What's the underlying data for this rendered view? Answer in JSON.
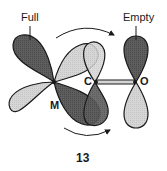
{
  "diagram": {
    "labels": {
      "full": "Full",
      "empty": "Empty"
    },
    "atoms": {
      "metal": "M",
      "carbon": "C",
      "oxygen": "O"
    },
    "figure_number": "13",
    "colors": {
      "dark_lobe": "#5a5a5a",
      "light_lobe": "#d4d4d4",
      "outline": "#1a1a1a",
      "background": "#ffffff"
    }
  }
}
